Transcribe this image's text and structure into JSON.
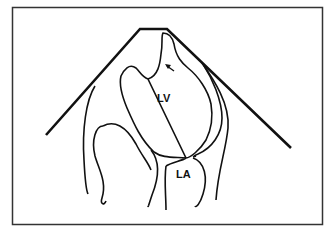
{
  "diagram": {
    "type": "echocardiographic apical view schematic",
    "labels": {
      "lv": "LV",
      "la": "LA"
    },
    "annotations": {
      "arrow": "arrow pointing to apical region of LV"
    },
    "colors": {
      "background": "#ffffff",
      "stroke": "#111111"
    }
  }
}
